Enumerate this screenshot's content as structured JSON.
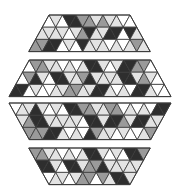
{
  "palette": {
    "W": "#ffffff",
    "L": "#e3e3e3",
    "M": "#9a9a9a",
    "D": "#2e2e2e",
    "stroke": "#3a3a3a"
  },
  "lattice": {
    "side": 13.5,
    "row_height": 12.2
  },
  "bands": [
    {
      "name": "band-1-top",
      "top_y": 15,
      "center_x": 89.5,
      "top_units": 6,
      "direction": "widen",
      "rows": [
        "WLWDDMMLMLLWW",
        "LLLLWLMDLLDDWDL",
        "MMDDWLWDLLLWLWLML"
      ]
    },
    {
      "name": "band-2-upper-middle",
      "top_y": 60,
      "center_x": 90,
      "top_units": 9,
      "direction": "widen",
      "rows": [
        "WMMLLWLWLDDLWLDDMMW",
        "WMDLWDDLLMDLLLLDDLMLW",
        "DDWLWWLLMMLLDDLWLWDDLWW"
      ]
    },
    {
      "name": "band-3-lower-middle",
      "top_y": 103,
      "center_x": 90,
      "top_units": 12,
      "direction": "narrow",
      "rows": [
        "WLLDLWLWDDMMLLMMWLWLWDDLW",
        "LMDDLLLLLWDDLDDMLDDLLLM",
        "MMMDDLWLWDMLLWLWWLMMW"
      ]
    },
    {
      "name": "band-4-bottom",
      "top_y": 148,
      "center_x": 89.5,
      "top_units": 9,
      "direction": "narrow",
      "rows": [
        "MMLLWLWLDDLWLWDDMMW",
        "DDLWDDLMMDLLLLLLL",
        "WLLWLMMWMLDDLWW"
      ]
    }
  ]
}
